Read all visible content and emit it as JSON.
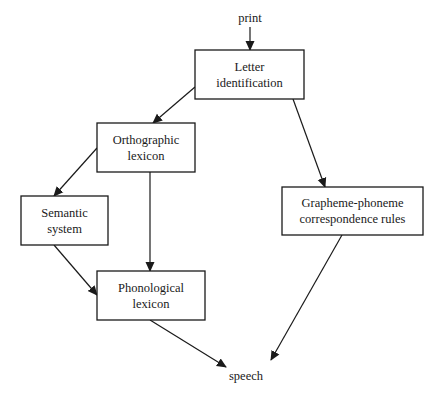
{
  "diagram": {
    "title": "",
    "colors": {
      "stroke": "#1a1a1a",
      "background": "#ffffff",
      "text": "#1a1a1a"
    },
    "terminals": [
      {
        "id": "print",
        "label": "print",
        "x": 250,
        "y": 22
      },
      {
        "id": "speech",
        "label": "speech",
        "x": 246,
        "y": 380
      }
    ],
    "nodes": [
      {
        "id": "letter",
        "lines": [
          "Letter",
          "identification"
        ],
        "x": 195,
        "y": 50,
        "w": 109,
        "h": 49
      },
      {
        "id": "ortho",
        "lines": [
          "Orthographic",
          "lexicon"
        ],
        "x": 97,
        "y": 123,
        "w": 98,
        "h": 49
      },
      {
        "id": "semantic",
        "lines": [
          "Semantic",
          "system"
        ],
        "x": 21,
        "y": 196,
        "w": 87,
        "h": 49
      },
      {
        "id": "phono",
        "lines": [
          "Phonological",
          "lexicon"
        ],
        "x": 97,
        "y": 271,
        "w": 108,
        "h": 49
      },
      {
        "id": "gpc",
        "lines": [
          "Grapheme-phoneme",
          "correspondence rules"
        ],
        "x": 282,
        "y": 187,
        "w": 141,
        "h": 48
      }
    ],
    "edges": [
      {
        "from": "print",
        "to": "letter",
        "x1": 250,
        "y1": 27,
        "x2": 250,
        "y2": 50
      },
      {
        "from": "letter",
        "to": "ortho",
        "x1": 195,
        "y1": 87,
        "x2": 153,
        "y2": 123
      },
      {
        "from": "letter",
        "to": "gpc",
        "x1": 293,
        "y1": 99,
        "x2": 325,
        "y2": 187
      },
      {
        "from": "ortho",
        "to": "semantic",
        "x1": 97,
        "y1": 148,
        "x2": 54,
        "y2": 196
      },
      {
        "from": "ortho",
        "to": "phono",
        "x1": 150,
        "y1": 172,
        "x2": 150,
        "y2": 271
      },
      {
        "from": "semantic",
        "to": "phono",
        "x1": 54,
        "y1": 245,
        "x2": 97,
        "y2": 295
      },
      {
        "from": "phono",
        "to": "speech",
        "x1": 150,
        "y1": 320,
        "x2": 226,
        "y2": 367
      },
      {
        "from": "gpc",
        "to": "speech",
        "x1": 342,
        "y1": 235,
        "x2": 271,
        "y2": 360
      }
    ]
  }
}
